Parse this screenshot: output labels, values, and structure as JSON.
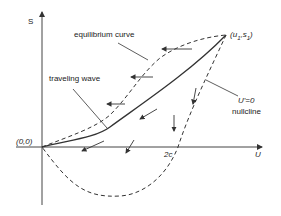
{
  "diagram": {
    "axes": {
      "y_label": "S",
      "x_label": "U",
      "origin_label": "(0,0)",
      "x_tick_label": "2c"
    },
    "point_label": "(u1,s1)",
    "point_label_main": "(u",
    "point_sub1": "1",
    "point_mid": ",s",
    "point_sub2": "1",
    "point_end": ")",
    "annotations": {
      "equilibrium_curve": "equilibrium curve",
      "traveling_wave": "traveling wave",
      "nullcline_eq": "U'=0",
      "nullcline": "nullcline"
    },
    "curves": [
      {
        "name": "equilibrium curve",
        "style": "dashed",
        "from": "(0,0)",
        "to": "(u1,s1)"
      },
      {
        "name": "traveling wave",
        "style": "solid",
        "from": "(0,0)",
        "to": "(u1,s1)"
      },
      {
        "name": "U'=0 nullcline",
        "style": "dashed",
        "from": "(u1,s1)",
        "through": "2c",
        "dips_below_axis": true
      }
    ],
    "colors": {
      "line": "#333333",
      "background": "#ffffff"
    }
  }
}
